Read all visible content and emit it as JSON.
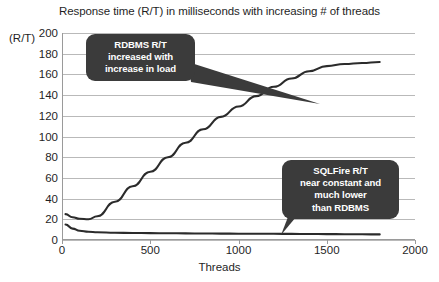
{
  "chart_data": {
    "type": "line",
    "title": "Response time (R/T) in milliseconds with increasing # of threads",
    "xlabel": "Threads",
    "ylabel": "(R/T)",
    "xlim": [
      0,
      2000
    ],
    "ylim": [
      0,
      200
    ],
    "xticks": [
      0,
      500,
      1000,
      1500,
      2000
    ],
    "yticks": [
      0,
      20,
      40,
      60,
      80,
      100,
      120,
      140,
      160,
      180,
      200
    ],
    "grid": true,
    "legend": "none",
    "series": [
      {
        "name": "RDBMS",
        "color": "#2b2b2b",
        "points": [
          [
            20,
            25
          ],
          [
            60,
            22
          ],
          [
            100,
            20.5
          ],
          [
            150,
            20
          ],
          [
            200,
            23
          ],
          [
            300,
            37
          ],
          [
            400,
            52
          ],
          [
            500,
            66
          ],
          [
            600,
            80
          ],
          [
            700,
            94
          ],
          [
            800,
            107
          ],
          [
            900,
            119
          ],
          [
            1000,
            129
          ],
          [
            1100,
            139
          ],
          [
            1200,
            148
          ],
          [
            1300,
            156
          ],
          [
            1400,
            163
          ],
          [
            1500,
            168
          ],
          [
            1600,
            170
          ],
          [
            1700,
            171
          ],
          [
            1800,
            172
          ]
        ]
      },
      {
        "name": "SQLFire",
        "color": "#2b2b2b",
        "points": [
          [
            20,
            15
          ],
          [
            60,
            11
          ],
          [
            100,
            9
          ],
          [
            150,
            8
          ],
          [
            200,
            7.5
          ],
          [
            300,
            7
          ],
          [
            400,
            6.8
          ],
          [
            500,
            6.6
          ],
          [
            600,
            6.5
          ],
          [
            700,
            6.4
          ],
          [
            800,
            6.3
          ],
          [
            900,
            6.2
          ],
          [
            1000,
            6.1
          ],
          [
            1100,
            6.0
          ],
          [
            1200,
            6.0
          ],
          [
            1300,
            5.9
          ],
          [
            1400,
            5.8
          ],
          [
            1500,
            5.7
          ],
          [
            1600,
            5.6
          ],
          [
            1700,
            5.5
          ],
          [
            1800,
            5.4
          ]
        ]
      }
    ],
    "annotations": [
      {
        "id": "rdbms-callout",
        "lines": [
          "RDBMS R/T",
          "increased with",
          "increase in load"
        ],
        "points_to": [
          1500,
          147
        ]
      },
      {
        "id": "sqlfire-callout",
        "lines": [
          "SQLFire R/T",
          "near constant and",
          "much lower",
          "than RDBMS"
        ],
        "points_to": [
          1240,
          6
        ]
      }
    ],
    "colors": {
      "background": "#ffffff",
      "gridline": "#b9b9b9",
      "axis": "#9a9a9a",
      "line": "#2b2b2b",
      "callout_bg": "#3b3b3b",
      "callout_text": "#ffffff",
      "text": "#1f1f1f"
    }
  }
}
